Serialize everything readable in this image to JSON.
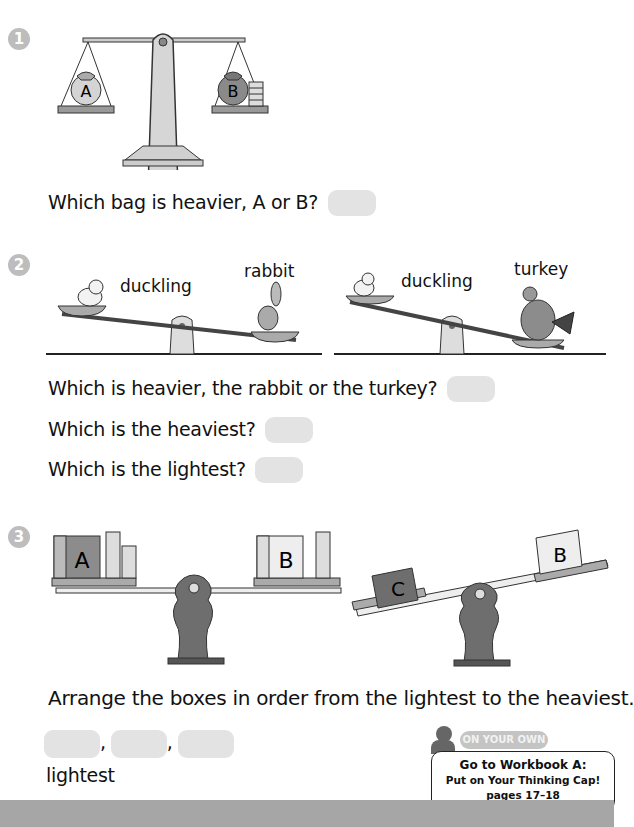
{
  "section1": {
    "number": "1",
    "scale": {
      "left_bag": "A",
      "right_bag": "B"
    },
    "question": "Which bag is heavier, A or B?"
  },
  "section2": {
    "number": "2",
    "seesaw_left": {
      "left_label": "duckling",
      "right_label": "rabbit"
    },
    "seesaw_right": {
      "left_label": "duckling",
      "right_label": "turkey"
    },
    "questions": [
      "Which is heavier, the rabbit or the turkey?",
      "Which is the heaviest?",
      "Which is the lightest?"
    ]
  },
  "section3": {
    "number": "3",
    "balance_left": {
      "left_box": "A",
      "right_box": "B"
    },
    "balance_right": {
      "left_box": "C",
      "right_box": "B"
    },
    "instruction": "Arrange the boxes in order from the lightest to the heaviest.",
    "separator": ",",
    "under_label": "lightest"
  },
  "on_your_own": {
    "tab": "ON YOUR OWN",
    "line1": "Go to Workbook A:",
    "line2": "Put on Your Thinking Cap!",
    "line3": "pages 17–18"
  },
  "colors": {
    "answer_box": "#e3e3e3",
    "number_badge": "#bdbdbd",
    "footer_bar": "#a6a6a6"
  }
}
